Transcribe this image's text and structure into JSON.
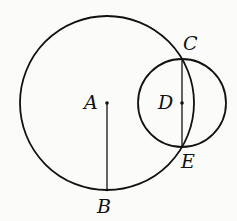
{
  "diagram": {
    "type": "geometry",
    "colors": {
      "stroke": "#111111",
      "background": "#fbfbfa"
    },
    "circles": [
      {
        "id": "circle-A",
        "center": "A",
        "cx": 107,
        "cy": 103,
        "r": 87
      },
      {
        "id": "circle-D",
        "center": "D",
        "cx": 182,
        "cy": 103,
        "r": 44
      }
    ],
    "segments": [
      {
        "id": "segment-AB",
        "from": "A",
        "to": "B"
      },
      {
        "id": "segment-CE",
        "from": "C",
        "to": "E"
      }
    ],
    "points": {
      "A": {
        "label": "A",
        "x": 107,
        "y": 103
      },
      "B": {
        "label": "B",
        "x": 107,
        "y": 190
      },
      "C": {
        "label": "C",
        "x": 182,
        "y": 59
      },
      "D": {
        "label": "D",
        "x": 182,
        "y": 103
      },
      "E": {
        "label": "E",
        "x": 182,
        "y": 147
      }
    }
  }
}
